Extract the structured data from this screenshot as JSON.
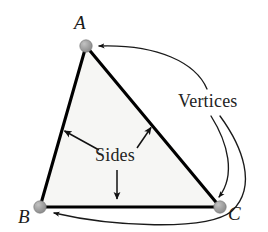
{
  "figure": {
    "background_color": "#ffffff",
    "fill_color": "#f6f6f4",
    "stroke_color": "#000000",
    "vertex_dot_color": "#9a9a9a",
    "vertex_dot_edge_color": "#7d7d7d",
    "annotation_color": "#232323"
  },
  "vertices": [
    {
      "label": "A",
      "x": 86,
      "y": 46
    },
    {
      "label": "B",
      "x": 40,
      "y": 207
    },
    {
      "label": "C",
      "x": 220,
      "y": 207
    }
  ],
  "labels": {
    "vertex_a": "A",
    "vertex_b": "B",
    "vertex_c": "C",
    "sides": "Sides",
    "vertices": "Vertices"
  },
  "annotations": [
    {
      "name": "sides-arrow-left",
      "from": "Sides",
      "to": "side AB",
      "tip_x": 63,
      "tip_y": 130
    },
    {
      "name": "sides-arrow-right",
      "from": "Sides",
      "to": "side AC",
      "tip_x": 152,
      "tip_y": 126
    },
    {
      "name": "sides-arrow-down",
      "from": "Sides",
      "to": "side BC",
      "tip_x": 117,
      "tip_y": 200
    },
    {
      "name": "vertices-curve-a",
      "from": "Vertices",
      "to": "vertex A",
      "tip_x": 96,
      "tip_y": 47
    },
    {
      "name": "vertices-curve-c",
      "from": "Vertices",
      "to": "vertex C",
      "tip_x": 217,
      "tip_y": 199
    },
    {
      "name": "vertices-curve-b",
      "from": "Vertices",
      "to": "vertex B",
      "tip_x": 50,
      "tip_y": 212
    }
  ]
}
